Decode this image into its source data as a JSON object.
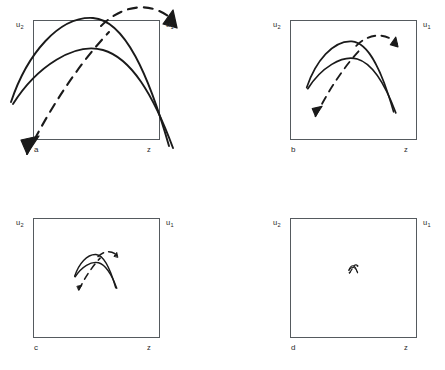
{
  "figure": {
    "width": 445,
    "height": 370,
    "background": "#ffffff",
    "stroke_color": "#1a1a1a",
    "box_border_color": "#555a5e",
    "axis_label_left": "u",
    "axis_label_left_sub": "2",
    "axis_label_right": "u",
    "axis_label_right_sub": "1",
    "baseline_label": "z"
  },
  "panels": [
    {
      "id": "a",
      "letter": "a",
      "label_top_left": "u",
      "label_top_left_sub": "2",
      "label_top_right": "u",
      "label_top_right_sub": "1",
      "label_bottom_right": "z",
      "box": {
        "x": 33,
        "y": 20,
        "w": 127,
        "h": 120
      },
      "motif_scale": 1.0,
      "motif_note": "two solid arcs converging lower-right, dashed curve with arrowhead lower-left, dashed arc with arrowhead upper-right"
    },
    {
      "id": "b",
      "letter": "b",
      "label_top_left": "u",
      "label_top_left_sub": "2",
      "label_top_right": "u",
      "label_top_right_sub": "1",
      "label_bottom_right": "z",
      "box": {
        "x": 290,
        "y": 20,
        "w": 127,
        "h": 120
      },
      "motif_scale": 0.55,
      "motif_note": "same motif reduced, centred upper middle"
    },
    {
      "id": "c",
      "letter": "c",
      "label_top_left": "u",
      "label_top_left_sub": "2",
      "label_top_right": "u",
      "label_top_right_sub": "1",
      "label_bottom_right": "z",
      "box": {
        "x": 33,
        "y": 218,
        "w": 127,
        "h": 120
      },
      "motif_scale": 0.26,
      "motif_note": "same motif strongly reduced, small glyph near upper middle"
    },
    {
      "id": "d",
      "letter": "d",
      "label_top_left": "u",
      "label_top_left_sub": "2",
      "label_top_right": "u",
      "label_top_right_sub": "1",
      "label_bottom_right": "z",
      "box": {
        "x": 290,
        "y": 218,
        "w": 127,
        "h": 120
      },
      "motif_scale": 0.055,
      "motif_note": "motif collapsed to a tiny dot-like mark"
    }
  ],
  "motif_geometry": {
    "viewbox": "0 0 200 200",
    "solid_arc_outer": "M 14 132 C 30 84 62 46 96 48 C 128 50 152 106 172 176",
    "solid_arc_inner": "M 16 134 C 40 96 78 72 106 80 C 134 88 156 124 176 178",
    "dashed_rising": "M 30 184 C 54 136 82 94 112 62",
    "dashed_arc_top": "M 104 56 C 126 34 156 30 178 52",
    "arrowhead_down_left": "M 30 184 L 42 166 L 24 170 Z",
    "arrowhead_down_right": "M 180 58 L 176 40 L 166 54 Z",
    "dash_pattern": "9 7",
    "stroke_width_solid": 1.9,
    "stroke_width_dashed": 2.1
  }
}
